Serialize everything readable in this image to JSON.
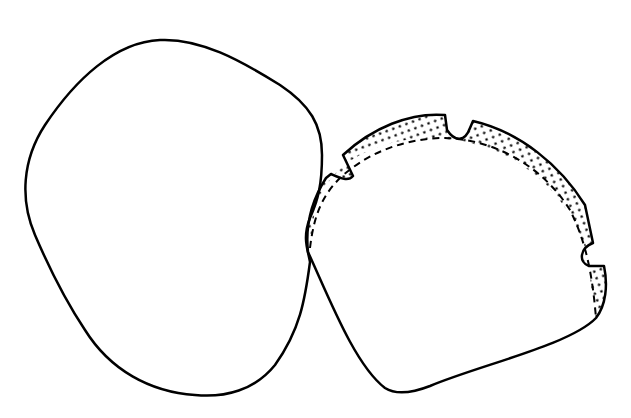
{
  "figure": {
    "colors": {
      "background": "#ffffff",
      "stroke": "#000000",
      "stipple": "#000000"
    },
    "shapes": [
      {
        "id": "left-shape",
        "label": ""
      },
      {
        "id": "right-shape",
        "label": ""
      },
      {
        "id": "stippled-band",
        "label": ""
      }
    ],
    "notch_count": 4
  }
}
